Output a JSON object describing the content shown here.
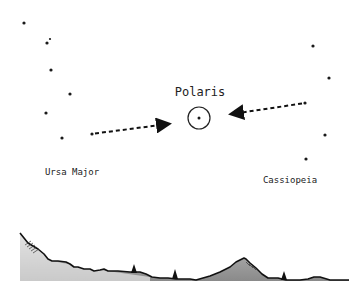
{
  "labels": {
    "polaris": "Polaris",
    "ursa_major": "Ursa Major",
    "cassiopeia": "Cassiopeia"
  },
  "colors": {
    "star": "#1a1a1a",
    "text": "#222222",
    "ground_fill": "#9a9a9a",
    "outline": "#111111"
  },
  "stars": {
    "ursa_major": [
      [
        24,
        23
      ],
      [
        47,
        43
      ],
      [
        51,
        70
      ],
      [
        70,
        94
      ],
      [
        46,
        113
      ],
      [
        62,
        138
      ],
      [
        92,
        134
      ]
    ],
    "polaris": [
      199,
      118
    ],
    "cassiopeia": [
      [
        313,
        46
      ],
      [
        329,
        78
      ],
      [
        305,
        103
      ],
      [
        325,
        135
      ],
      [
        306,
        159
      ]
    ]
  },
  "arrows": [
    {
      "from": [
        92,
        134
      ],
      "to": [
        170,
        124
      ],
      "name": "ursa-major-pointer"
    },
    {
      "from": [
        305,
        103
      ],
      "to": [
        229,
        114
      ],
      "name": "cassiopeia-pointer"
    }
  ]
}
